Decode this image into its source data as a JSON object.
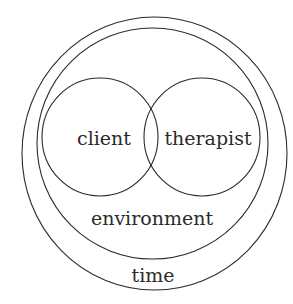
{
  "diagram": {
    "type": "nested-venn",
    "labels": {
      "client": "client",
      "therapist": "therapist",
      "environment": "environment",
      "time": "time"
    },
    "stroke_color": "#2b2b2b",
    "background": "#ffffff"
  }
}
